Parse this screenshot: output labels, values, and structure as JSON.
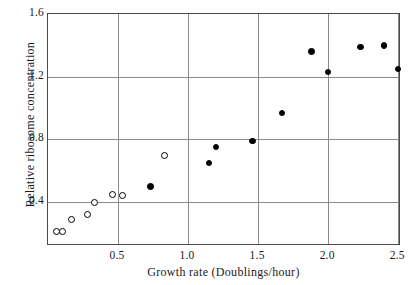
{
  "chart_data": {
    "type": "scatter",
    "title": "",
    "xlabel": "Growth rate (Doublings/hour)",
    "ylabel": "Relative ribosome concentration",
    "xlim": [
      0.0,
      2.52
    ],
    "ylim": [
      0.12,
      1.6
    ],
    "xticks": [
      "0.5",
      "1.0",
      "1.5",
      "2.0",
      "2.5"
    ],
    "xtick_values": [
      0.5,
      1.0,
      1.5,
      2.0,
      2.5
    ],
    "yticks": [
      "0.4",
      "0.8",
      "1.2",
      "1.6"
    ],
    "ytick_values": [
      0.4,
      0.8,
      1.2,
      1.6
    ],
    "grid": "both",
    "legend": "none",
    "series": [
      {
        "name": "open-circles",
        "marker": "open circle",
        "color": "#000000",
        "points": [
          {
            "x": 0.06,
            "y": 0.21
          },
          {
            "x": 0.1,
            "y": 0.21
          },
          {
            "x": 0.17,
            "y": 0.29
          },
          {
            "x": 0.28,
            "y": 0.32
          },
          {
            "x": 0.33,
            "y": 0.4
          },
          {
            "x": 0.46,
            "y": 0.45
          },
          {
            "x": 0.53,
            "y": 0.44
          },
          {
            "x": 0.83,
            "y": 0.7
          }
        ]
      },
      {
        "name": "filled-circles",
        "marker": "filled circle",
        "color": "#000000",
        "points": [
          {
            "x": 0.73,
            "y": 0.5
          },
          {
            "x": 1.15,
            "y": 0.65
          },
          {
            "x": 1.2,
            "y": 0.75
          },
          {
            "x": 1.46,
            "y": 0.79
          },
          {
            "x": 1.67,
            "y": 0.97
          },
          {
            "x": 1.88,
            "y": 1.36
          },
          {
            "x": 2.0,
            "y": 1.23
          },
          {
            "x": 2.23,
            "y": 1.39
          },
          {
            "x": 2.4,
            "y": 1.4
          },
          {
            "x": 2.5,
            "y": 1.25
          }
        ]
      }
    ]
  }
}
